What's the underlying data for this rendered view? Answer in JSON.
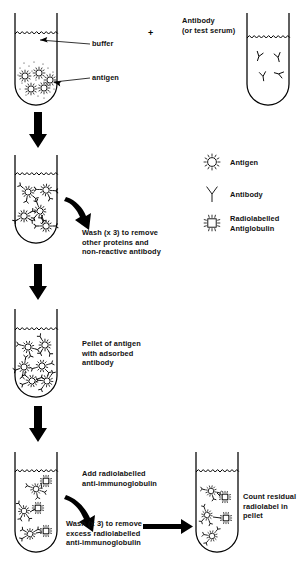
{
  "diagram": {
    "plus_sign": "+"
  },
  "labels": {
    "buffer": "buffer",
    "antigen": "antigen",
    "antibody_title": "Antibody",
    "antibody_sub": "(or test serum)",
    "wash1": "Wash (x 3) to remove\nother proteins and\nnon-reactive antibody",
    "pellet": "Pellet of antigen\nwith adsorbed\nantibody",
    "add_radiolabel": "Add radiolabelled\nanti-immunoglobulin",
    "wash2": "Wash (x 3) to remove\nexcess radiolabelled\nanti-immunoglobulin",
    "count": "Count residual\nradiolabel in\npellet"
  },
  "legend": {
    "items": [
      {
        "icon": "antigen-icon",
        "label": "Antigen"
      },
      {
        "icon": "antibody-icon",
        "label": "Antibody"
      },
      {
        "icon": "radiolabelled-antiglobulin-icon",
        "label": "Radiolabelled\nAntiglobulin"
      }
    ]
  },
  "tubes": [
    {
      "name": "tube-antigen-buffer",
      "stage": 1,
      "contents": "antigen particles settled at base in buffer"
    },
    {
      "name": "tube-antibody",
      "stage": 1,
      "contents": "free antibody molecules in serum"
    },
    {
      "name": "tube-complexes-suspended",
      "stage": 2,
      "contents": "antigen-antibody complexes"
    },
    {
      "name": "tube-pellet",
      "stage": 3,
      "contents": "pellet of antigen with adsorbed antibody"
    },
    {
      "name": "tube-radiolabel-added",
      "stage": 4,
      "contents": "complexes bound to radiolabelled antiglobulin"
    },
    {
      "name": "tube-final-pellet",
      "stage": 5,
      "contents": "washed pellet with residual radiolabel"
    }
  ],
  "colors": {
    "ink": "#000000",
    "background": "#ffffff"
  }
}
